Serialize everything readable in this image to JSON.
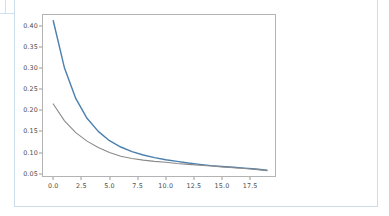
{
  "figure": {
    "background_color": "#ffffff",
    "frame_color": "#ccdcea",
    "axes_edge_color": "#b3b3b3"
  },
  "chart_data": {
    "type": "line",
    "title": "",
    "subtitle": "",
    "xlabel": "",
    "ylabel": "",
    "xlim": [
      -1.0,
      19.8
    ],
    "ylim": [
      0.042,
      0.428
    ],
    "grid": false,
    "legend": null,
    "xticks": [
      0.0,
      2.5,
      5.0,
      7.5,
      10.0,
      12.5,
      15.0,
      17.5
    ],
    "xtick_labels": [
      "0.0",
      "2.5",
      "5.0",
      "7.5",
      "10.0",
      "12.5",
      "15.0",
      "17.5"
    ],
    "yticks": [
      0.05,
      0.1,
      0.15,
      0.2,
      0.25,
      0.3,
      0.35,
      0.4
    ],
    "ytick_labels": [
      "0.05",
      "0.10",
      "0.15",
      "0.20",
      "0.25",
      "0.30",
      "0.35",
      "0.40"
    ],
    "x": [
      0,
      1,
      2,
      3,
      4,
      5,
      6,
      7,
      8,
      9,
      10,
      11,
      12,
      13,
      14,
      15,
      16,
      17,
      18,
      19
    ],
    "series": [
      {
        "name": "series-1",
        "color": "#4a7fae",
        "linewidth": 1.4,
        "values": [
          0.412,
          0.3,
          0.228,
          0.181,
          0.15,
          0.128,
          0.113,
          0.102,
          0.094,
          0.088,
          0.083,
          0.079,
          0.075,
          0.072,
          0.069,
          0.067,
          0.065,
          0.063,
          0.061,
          0.058
        ]
      },
      {
        "name": "series-2",
        "color": "#8a8a8a",
        "linewidth": 1.1,
        "values": [
          0.215,
          0.175,
          0.147,
          0.127,
          0.112,
          0.1,
          0.091,
          0.086,
          0.082,
          0.079,
          0.077,
          0.074,
          0.072,
          0.07,
          0.068,
          0.066,
          0.064,
          0.062,
          0.06,
          0.057
        ]
      }
    ]
  }
}
